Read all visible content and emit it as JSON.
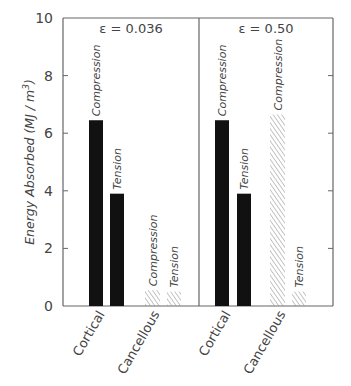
{
  "chart_data": {
    "type": "bar",
    "title": "",
    "ylabel": "Energy Absorbed (MJ / m³)",
    "ylabel_parts": {
      "main": "Energy  Absorbed  (MJ / m",
      "sup": "3",
      "end": ")"
    },
    "xlabel": "",
    "ylim": [
      0,
      10
    ],
    "yticks": [
      0,
      2,
      4,
      6,
      8,
      10
    ],
    "grid": false,
    "panels": [
      {
        "label": "ε = 0.036",
        "label_text": "ε = 0.036",
        "groups": [
          {
            "name": "Cortical",
            "bars": [
              {
                "name": "Compression",
                "value": 6.45,
                "fill": "solid"
              },
              {
                "name": "Tension",
                "value": 3.9,
                "fill": "solid"
              }
            ]
          },
          {
            "name": "Cancellous",
            "bars": [
              {
                "name": "Compression",
                "value": 0.55,
                "fill": "hatched"
              },
              {
                "name": "Tension",
                "value": 0.5,
                "fill": "hatched"
              }
            ]
          }
        ]
      },
      {
        "label": "ε = 0.50",
        "label_text": "ε = 0.50",
        "groups": [
          {
            "name": "Cortical",
            "bars": [
              {
                "name": "Compression",
                "value": 6.45,
                "fill": "solid"
              },
              {
                "name": "Tension",
                "value": 3.9,
                "fill": "solid"
              }
            ]
          },
          {
            "name": "Cancellous",
            "bars": [
              {
                "name": "Compression",
                "value": 6.65,
                "fill": "hatched"
              },
              {
                "name": "Tension",
                "value": 0.5,
                "fill": "hatched"
              }
            ]
          }
        ]
      }
    ]
  },
  "colors": {
    "solid_bar": "#111111",
    "hatch": "#8a8a8a",
    "axis": "#555555",
    "text": "#444444"
  }
}
